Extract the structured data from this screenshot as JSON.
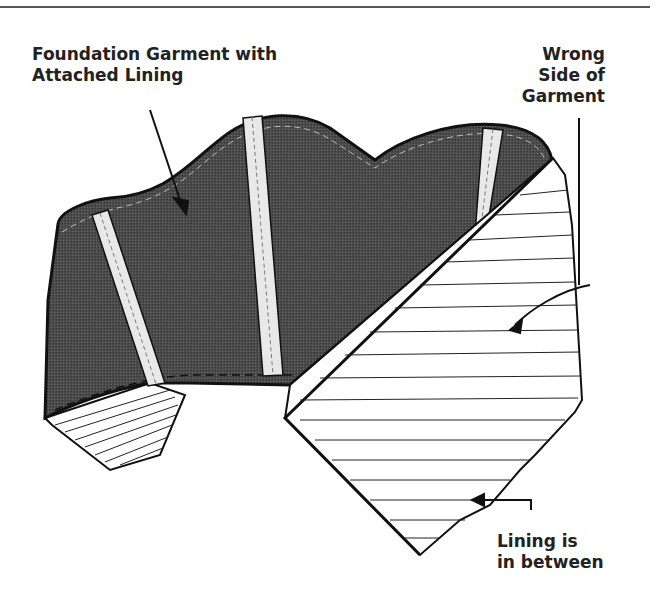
{
  "diagram": {
    "title_rule": true,
    "colors": {
      "garment_fill": "#4a4a4a",
      "lining_fill": "#ffffff",
      "line": "#111111",
      "bone_fill": "#e8e8e8"
    },
    "labels": {
      "foundation": {
        "line1": "Foundation Garment with",
        "line2": "Attached Lining"
      },
      "wrong_side": {
        "line1": "Wrong",
        "line2": "Side of",
        "line3": "Garment"
      },
      "lining": {
        "line1": "Lining is",
        "line2": "in between"
      }
    },
    "parts": [
      "foundation-garment-outer",
      "boning-channel-1",
      "boning-channel-2",
      "boning-channel-3",
      "folded-lining-left",
      "wrong-side-of-garment"
    ]
  }
}
